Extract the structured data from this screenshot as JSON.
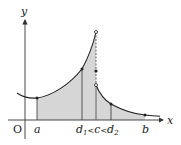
{
  "diagram": {
    "type": "piecewise-function-graph",
    "axes": {
      "x_label": "x",
      "y_label": "y",
      "origin_label": "O"
    },
    "x_ticks": [
      {
        "name": "a",
        "label": "a"
      },
      {
        "name": "d1-c-d2",
        "label_parts": [
          "d",
          "1",
          "<",
          "c",
          "<",
          "d",
          "2"
        ]
      },
      {
        "name": "b",
        "label": "b"
      }
    ],
    "points": {
      "a": {
        "filled": true
      },
      "d1": {
        "filled": true
      },
      "c_top": {
        "filled": false
      },
      "c_mid": {
        "filled": true
      },
      "c_bottom": {
        "filled": false
      },
      "d2": {
        "filled": true
      },
      "b": {
        "filled": true
      }
    },
    "shading": {
      "left_region": "from a to c under left branch",
      "right_region": "from c to b under right branch",
      "fill_color": "#d6d6d6"
    },
    "colors": {
      "curve": "#222222",
      "axis": "#333333",
      "shade": "#d6d6d6",
      "dashed": "#444444"
    }
  }
}
